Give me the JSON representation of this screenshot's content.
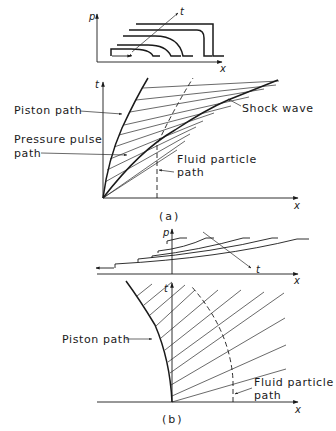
{
  "figure": {
    "panel_a": {
      "caption": "(a)",
      "pressure_plot": {
        "y_axis_label": "p",
        "x_axis_label": "x",
        "time_arrow_label": "t"
      },
      "tx_plot": {
        "y_axis_label": "t",
        "x_axis_label": "x",
        "labels": {
          "piston_path": "Piston path",
          "pressure_pulse_path_line1": "Pressure pulse",
          "pressure_pulse_path_line2": "path",
          "shock_wave": "Shock wave",
          "fluid_particle_line1": "Fluid particle",
          "fluid_particle_line2": "path"
        }
      }
    },
    "panel_b": {
      "caption": "(b)",
      "pressure_plot": {
        "y_axis_label": "p",
        "x_axis_label": "x",
        "time_arrow_label": "t"
      },
      "tx_plot": {
        "y_axis_label": "t",
        "x_axis_label": "x",
        "labels": {
          "piston_path": "Piston path",
          "fluid_particle_line1": "Fluid particle",
          "fluid_particle_line2": "path"
        }
      }
    }
  }
}
